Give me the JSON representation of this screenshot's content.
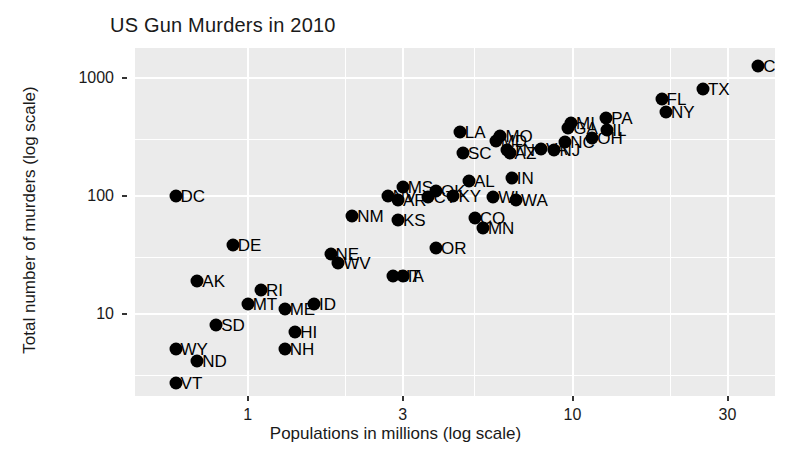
{
  "chart_data": {
    "type": "scatter",
    "title": "US Gun Murders in 2010",
    "xlabel": "Populations in millions (log scale)",
    "ylabel": "Total number of murders (log scale)",
    "xscale": "log",
    "yscale": "log",
    "xlim": [
      0.45,
      42
    ],
    "ylim": [
      2.0,
      1800
    ],
    "xticks": [
      1,
      3,
      10,
      30
    ],
    "xticklabels": [
      "1",
      "3",
      "10",
      "30"
    ],
    "yticks": [
      10,
      100,
      1000
    ],
    "yticklabels": [
      "10",
      "100",
      "1000"
    ],
    "grid": true,
    "grid_color": "#ffffff",
    "panel_color": "#ebebeb",
    "point_color": "#000000",
    "legend": "none",
    "point_label_field": "state",
    "points": [
      {
        "state": "CA",
        "population": 37.3,
        "murders": 1257
      },
      {
        "state": "TX",
        "population": 25.2,
        "murders": 805
      },
      {
        "state": "FL",
        "population": 18.8,
        "murders": 669
      },
      {
        "state": "NY",
        "population": 19.4,
        "murders": 517
      },
      {
        "state": "PA",
        "population": 12.7,
        "murders": 457
      },
      {
        "state": "MI",
        "population": 9.9,
        "murders": 413
      },
      {
        "state": "IL",
        "population": 12.8,
        "murders": 364
      },
      {
        "state": "OH",
        "population": 11.5,
        "murders": 310
      },
      {
        "state": "GA",
        "population": 9.7,
        "murders": 376
      },
      {
        "state": "NJ",
        "population": 8.8,
        "murders": 246
      },
      {
        "state": "NC",
        "population": 9.5,
        "murders": 286
      },
      {
        "state": "LA",
        "population": 4.5,
        "murders": 351
      },
      {
        "state": "MO",
        "population": 6.0,
        "murders": 321
      },
      {
        "state": "SC",
        "population": 4.6,
        "murders": 230
      },
      {
        "state": "VA",
        "population": 8.0,
        "murders": 250
      },
      {
        "state": "MD",
        "population": 5.8,
        "murders": 293
      },
      {
        "state": "TN",
        "population": 6.3,
        "murders": 243
      },
      {
        "state": "AZ",
        "population": 6.4,
        "murders": 232
      },
      {
        "state": "AL",
        "population": 4.8,
        "murders": 135
      },
      {
        "state": "IN",
        "population": 6.5,
        "murders": 142
      },
      {
        "state": "MS",
        "population": 3.0,
        "murders": 120
      },
      {
        "state": "OK",
        "population": 3.8,
        "murders": 111
      },
      {
        "state": "AR",
        "population": 2.9,
        "murders": 93
      },
      {
        "state": "KY",
        "population": 4.3,
        "murders": 100
      },
      {
        "state": "WI",
        "population": 5.7,
        "murders": 97
      },
      {
        "state": "WA",
        "population": 6.7,
        "murders": 93
      },
      {
        "state": "NV",
        "population": 2.7,
        "murders": 100
      },
      {
        "state": "CT",
        "population": 3.6,
        "murders": 97
      },
      {
        "state": "DC",
        "population": 0.6,
        "murders": 99
      },
      {
        "state": "CO",
        "population": 5.0,
        "murders": 65
      },
      {
        "state": "MN",
        "population": 5.3,
        "murders": 53
      },
      {
        "state": "KS",
        "population": 2.9,
        "murders": 63
      },
      {
        "state": "NM",
        "population": 2.1,
        "murders": 67
      },
      {
        "state": "DE",
        "population": 0.9,
        "murders": 38
      },
      {
        "state": "NE",
        "population": 1.8,
        "murders": 32
      },
      {
        "state": "WV",
        "population": 1.9,
        "murders": 27
      },
      {
        "state": "OR",
        "population": 3.8,
        "murders": 36
      },
      {
        "state": "UT",
        "population": 2.8,
        "murders": 21
      },
      {
        "state": "IA",
        "population": 3.0,
        "murders": 21
      },
      {
        "state": "AK",
        "population": 0.7,
        "murders": 19
      },
      {
        "state": "RI",
        "population": 1.1,
        "murders": 16
      },
      {
        "state": "MT",
        "population": 1.0,
        "murders": 12
      },
      {
        "state": "ME",
        "population": 1.3,
        "murders": 11
      },
      {
        "state": "ID",
        "population": 1.6,
        "murders": 12
      },
      {
        "state": "SD",
        "population": 0.8,
        "murders": 8
      },
      {
        "state": "HI",
        "population": 1.4,
        "murders": 7
      },
      {
        "state": "NH",
        "population": 1.3,
        "murders": 5
      },
      {
        "state": "WY",
        "population": 0.6,
        "murders": 5
      },
      {
        "state": "ND",
        "population": 0.7,
        "murders": 4
      },
      {
        "state": "VT",
        "population": 0.6,
        "murders": 2.6
      }
    ]
  }
}
